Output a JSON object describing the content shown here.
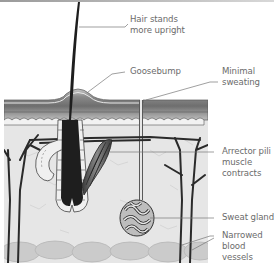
{
  "diagram": {
    "labels": [
      {
        "id": "hair",
        "lines": [
          "Hair stands",
          "more upright"
        ]
      },
      {
        "id": "goosebump",
        "lines": [
          "Goosebump"
        ]
      },
      {
        "id": "sweating",
        "lines": [
          "Minimal",
          "sweating"
        ]
      },
      {
        "id": "arrector",
        "lines": [
          "Arrector pili",
          "muscle",
          "contracts"
        ]
      },
      {
        "id": "sweat-gland",
        "lines": [
          "Sweat gland"
        ]
      },
      {
        "id": "vessels",
        "lines": [
          "Narrowed",
          "blood",
          "vessels"
        ]
      }
    ],
    "colors": {
      "text": "#6b6b6b",
      "leader": "#777777",
      "hair": "#1e1e1e",
      "epidermis": "#7a7a7a",
      "dermis_bg": "#e4e4e4",
      "fat": "#cfcfcf"
    }
  }
}
